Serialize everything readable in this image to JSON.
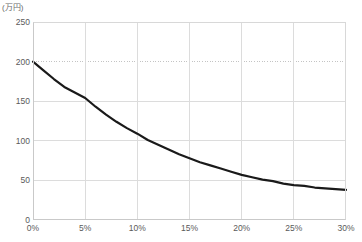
{
  "chart_data": {
    "type": "line",
    "title": "",
    "subtitle": "",
    "unit_label": "(万円)",
    "xlabel": "",
    "ylabel": "",
    "ylim": [
      0,
      250
    ],
    "xlim": [
      0,
      30
    ],
    "grid": true,
    "legend": null,
    "y_ticks": [
      250,
      200,
      150,
      100,
      50,
      0
    ],
    "y_tick_labels": [
      "250",
      "200",
      "150",
      "100",
      "50",
      "0"
    ],
    "x_ticks": [
      0,
      5,
      10,
      15,
      20,
      25,
      30
    ],
    "x_tick_labels": [
      "0%",
      "5%",
      "10%",
      "15%",
      "20%",
      "25%",
      "30%"
    ],
    "dotted_gridline_y": 200,
    "line_color": "#1a1a1a",
    "grid_color": "#dcdcdc",
    "axis_color": "#c9c9c9",
    "text_color": "#5a5a5a",
    "series": [
      {
        "name": "",
        "x": [
          0,
          1,
          2,
          3,
          4,
          5,
          6,
          7,
          8,
          9,
          10,
          11,
          12,
          13,
          14,
          15,
          16,
          17,
          18,
          19,
          20,
          21,
          22,
          23,
          24,
          25,
          26,
          27,
          28,
          29,
          30
        ],
        "values": [
          200,
          189,
          178,
          168,
          161,
          154,
          143,
          133,
          124,
          116,
          109,
          101,
          95,
          89,
          83,
          78,
          73,
          69,
          65,
          61,
          57,
          54,
          51,
          49,
          46,
          44,
          43,
          41,
          40,
          39,
          38
        ]
      }
    ]
  }
}
